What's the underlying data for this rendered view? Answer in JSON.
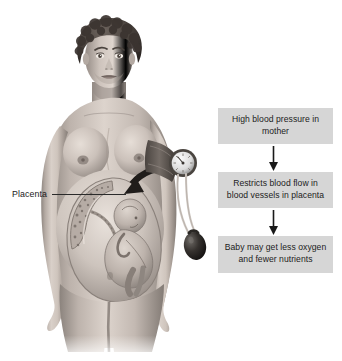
{
  "figure": {
    "subject_description": "Pregnant woman with blood pressure cuff, cutaway showing fetus and placenta",
    "background_color": "#ffffff",
    "ink_color": "#1b1b1b"
  },
  "callouts": [
    {
      "name": "placenta",
      "label": "Placenta",
      "leader_line": true
    }
  ],
  "flowchart": {
    "box_fill": "#d6d6d6",
    "text_color": "#1c1c1c",
    "arrow_color": "#1a1a1a",
    "steps": [
      {
        "id": "step-1",
        "text": "High blood pressure in mother"
      },
      {
        "id": "step-2",
        "text": "Restricts blood flow in blood vessels in placenta"
      },
      {
        "id": "step-3",
        "text": "Baby may get less oxygen and fewer nutrients"
      }
    ],
    "arrows": [
      {
        "id": "arrow-1",
        "direction": "down"
      },
      {
        "id": "arrow-2",
        "direction": "down"
      }
    ]
  },
  "illustration_parts": {
    "hair": "short dark curly hair",
    "skin_tone": "#b9aea6",
    "cuff": "blood pressure cuff on left arm",
    "gauge": "round pressure gauge dial",
    "bulb": "rubber inflation bulb",
    "tubing": "two rubber tubes",
    "uterus_cutaway": "cutaway of uterus with fetus",
    "placenta_shape": "placenta lining uterine wall",
    "pointer_arrow": "curved arrow pointing to placenta"
  }
}
